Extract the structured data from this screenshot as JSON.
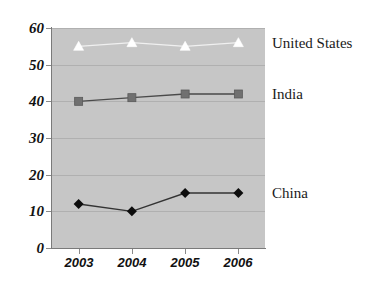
{
  "chart_data": {
    "type": "line",
    "title": "",
    "subtitle": "",
    "xlabel": "",
    "ylabel": "",
    "categories": [
      "2003",
      "2004",
      "2005",
      "2006"
    ],
    "x": [
      2003,
      2004,
      2005,
      2006
    ],
    "ylim": [
      0,
      60
    ],
    "yticks": [
      0,
      10,
      20,
      30,
      40,
      50,
      60
    ],
    "ytick_labels": [
      "0",
      "10",
      "20",
      "30",
      "40",
      "50",
      "60"
    ],
    "grid": true,
    "legend_position": "right",
    "plot_background": "#c6c6c6",
    "series": [
      {
        "name": "United States",
        "values": [
          55,
          56,
          55,
          56
        ],
        "color": "#f2f2f2",
        "marker": "triangle",
        "marker_color": "#ffffff",
        "line_color": "#f0f0f0"
      },
      {
        "name": "India",
        "values": [
          40,
          41,
          42,
          42
        ],
        "color": "#6e6e6e",
        "marker": "square",
        "marker_color": "#707070",
        "line_color": "#4a4a4a"
      },
      {
        "name": "China",
        "values": [
          12,
          10,
          15,
          15
        ],
        "color": "#111111",
        "marker": "diamond",
        "marker_color": "#0d0d0d",
        "line_color": "#333333"
      }
    ]
  },
  "legend": {
    "entries": [
      {
        "label": "United States"
      },
      {
        "label": "India"
      },
      {
        "label": "China"
      }
    ]
  },
  "axes": {
    "y_tick_labels": [
      "60",
      "50",
      "40",
      "30",
      "20",
      "10",
      "0"
    ],
    "x_tick_labels": [
      "2003",
      "2004",
      "2005",
      "2006"
    ]
  }
}
